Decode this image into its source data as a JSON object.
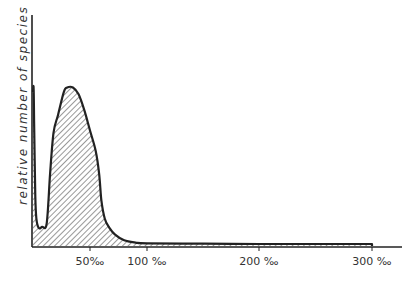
{
  "chart_data": {
    "type": "area",
    "title": "",
    "xlabel": "",
    "ylabel": "relative number of species",
    "x_unit": "‰",
    "x_ticks": [
      50,
      100,
      200,
      300
    ],
    "x_tick_labels": [
      "50‰",
      "100 ‰",
      "200 ‰",
      "300 ‰"
    ],
    "xlim": [
      0,
      320
    ],
    "ylim": [
      0,
      1
    ],
    "grid": false,
    "legend": null,
    "fill": "diagonal hatch",
    "series": [
      {
        "name": "relative number of species",
        "x": [
          0,
          0.5,
          1,
          2,
          3,
          5,
          8,
          12,
          15,
          18,
          22,
          27,
          30,
          35,
          40,
          45,
          50,
          55,
          58,
          60,
          63,
          67,
          72,
          80,
          90,
          100,
          150,
          200,
          250,
          300
        ],
        "values": [
          0.68,
          0.7,
          0.55,
          0.22,
          0.12,
          0.08,
          0.085,
          0.1,
          0.32,
          0.5,
          0.58,
          0.68,
          0.7,
          0.7,
          0.67,
          0.6,
          0.51,
          0.42,
          0.32,
          0.2,
          0.12,
          0.08,
          0.05,
          0.025,
          0.015,
          0.012,
          0.01,
          0.009,
          0.009,
          0.009
        ]
      }
    ]
  },
  "labels": {
    "y_axis": "relative number of species",
    "x_ticks": [
      "50‰",
      "100 ‰",
      "200 ‰",
      "300 ‰"
    ]
  }
}
